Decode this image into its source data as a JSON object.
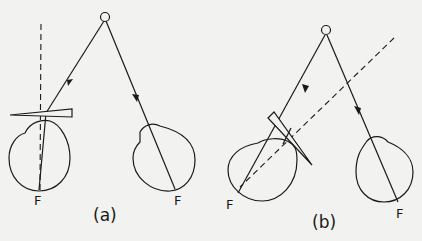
{
  "figure": {
    "background": "#f2f2f0",
    "stroke_color": "#1a1a1a",
    "panels": [
      {
        "id": "a",
        "caption": "(a)",
        "object_label": "O",
        "left_fovea_label": "F",
        "right_fovea_label": "F"
      },
      {
        "id": "b",
        "caption": "(b)",
        "object_label": "O",
        "left_fovea_label": "F",
        "right_fovea_label": "F"
      }
    ]
  }
}
